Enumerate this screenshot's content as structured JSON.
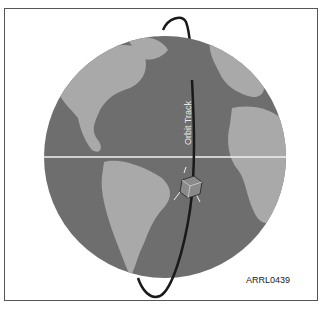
{
  "figure": {
    "orbit_label": "Orbit Track",
    "figure_code": "ARRL0439",
    "colors": {
      "ocean": "#6e6e6e",
      "land": "#a9a9a9",
      "orbit": "#1a1a1a",
      "equator": "#f2f2f2",
      "border": "#555555"
    },
    "elements": [
      "globe",
      "equator-line",
      "orbit-track",
      "satellite"
    ]
  }
}
